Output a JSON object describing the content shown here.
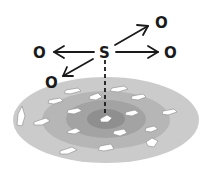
{
  "diagram": {
    "center_label": "S",
    "targets": [
      {
        "id": "top-right",
        "label": "O"
      },
      {
        "id": "right",
        "label": "O"
      },
      {
        "id": "left",
        "label": "O"
      },
      {
        "id": "bottom-left",
        "label": "O"
      }
    ],
    "rings": [
      {
        "name": "outer",
        "color": "#cbcbcb"
      },
      {
        "name": "middle",
        "color": "#b6b6b6"
      },
      {
        "name": "inner",
        "color": "#a3a3a3"
      },
      {
        "name": "core",
        "color": "#8f8f8f"
      }
    ],
    "flake_color": "#ffffff",
    "arrow_color": "#1a1a1a"
  }
}
